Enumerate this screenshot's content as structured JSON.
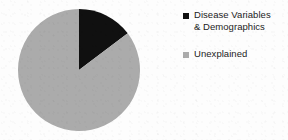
{
  "chart_data": {
    "type": "pie",
    "title": "",
    "categories": [
      "Disease Variables & Demographics",
      "Unexplained"
    ],
    "values": [
      15,
      85
    ],
    "units": "percent",
    "colors": [
      "#101010",
      "#ababab"
    ],
    "start_angle_deg": 0,
    "direction": "clockwise",
    "legend_position": "right",
    "grid": false,
    "slices": [
      {
        "label": "Disease Variables & Demographics",
        "label_line1": "Disease Variables",
        "label_line2": "& Demographics",
        "value": 15,
        "color": "#101010",
        "start_deg": 0,
        "end_deg": 53
      },
      {
        "label": "Unexplained",
        "label_line1": "Unexplained",
        "label_line2": "",
        "value": 85,
        "color": "#ababab",
        "start_deg": 53,
        "end_deg": 360
      }
    ]
  },
  "legend": {
    "items": [
      {
        "label": "Disease Variables\n& Demographics",
        "swatch_color": "#101010",
        "swatch_icon": "square-marker-icon"
      },
      {
        "label": "Unexplained",
        "swatch_color": "#ababab",
        "swatch_icon": "square-marker-icon"
      }
    ]
  },
  "figure": {
    "background_color": "#fdfdfd",
    "text_color": "#1c1c1c"
  }
}
